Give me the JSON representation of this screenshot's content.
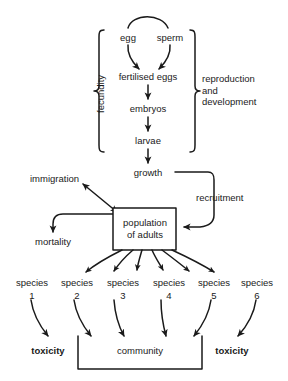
{
  "diagram": {
    "background_color": "#ffffff",
    "line_color": "#1a1a1a",
    "nodes": {
      "egg": "egg",
      "sperm": "sperm",
      "fertilised_eggs": "fertilised eggs",
      "embryos": "embryos",
      "larvae": "larvae",
      "growth": "growth",
      "immigration": "immigration",
      "mortality": "mortality",
      "recruitment": "recruitment",
      "population_of_adults": "population\nof adults",
      "community": "community",
      "toxicity_left": "toxicity",
      "toxicity_right": "toxicity"
    },
    "brackets": {
      "fecundity": "fecundity",
      "reproduction_and_development": "reproduction\nand\ndevelopment"
    },
    "species": [
      {
        "name": "species",
        "number": "1"
      },
      {
        "name": "species",
        "number": "2"
      },
      {
        "name": "species",
        "number": "3"
      },
      {
        "name": "species",
        "number": "4"
      },
      {
        "name": "species",
        "number": "5"
      },
      {
        "name": "species",
        "number": "6"
      }
    ]
  }
}
